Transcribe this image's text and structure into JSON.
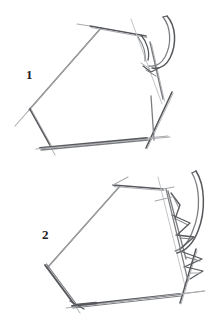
{
  "document": {
    "type": "pencil-sketch-illustration",
    "background_color": "#ffffff",
    "stroke_color": "#7b7d80",
    "stroke_color_dark": "#56585c",
    "stroke_color_light": "#a9abae",
    "label_color": "#1d1d1d",
    "width": 223,
    "height": 326
  },
  "figures": [
    {
      "label": "1",
      "description": "angular five-sided outline with overshooting sketch strokes and a curved double-line hook at the upper right"
    },
    {
      "label": "2",
      "description": "angular five-sided outline with overshooting sketch strokes and a feathered barbed branch along the right edge"
    }
  ]
}
